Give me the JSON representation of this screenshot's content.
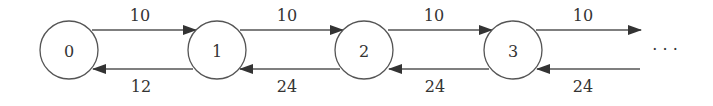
{
  "diagram": {
    "type": "birth-death chain",
    "nodes": [
      {
        "id": "0",
        "label": "0"
      },
      {
        "id": "1",
        "label": "1"
      },
      {
        "id": "2",
        "label": "2"
      },
      {
        "id": "3",
        "label": "3"
      }
    ],
    "forward_edges": [
      {
        "from": "0",
        "to": "1",
        "label": "10"
      },
      {
        "from": "1",
        "to": "2",
        "label": "10"
      },
      {
        "from": "2",
        "to": "3",
        "label": "10"
      },
      {
        "from": "3",
        "to": "...",
        "label": "10"
      }
    ],
    "backward_edges": [
      {
        "from": "1",
        "to": "0",
        "label": "12"
      },
      {
        "from": "2",
        "to": "1",
        "label": "24"
      },
      {
        "from": "3",
        "to": "2",
        "label": "24"
      },
      {
        "from": "...",
        "to": "3",
        "label": "24"
      }
    ],
    "continuation": "· · ·"
  }
}
